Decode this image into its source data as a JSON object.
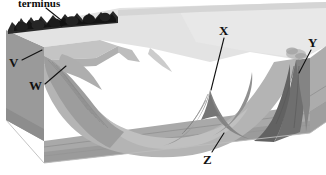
{
  "figure": {
    "kind": "block-diagram",
    "title_partial": "terminus",
    "palette": {
      "background": "#ffffff",
      "upland_surface": "#e3e3e3",
      "upper_slope": "#c9c9c9",
      "valley_floor": "#b4b4b4",
      "mid_slope": "#9d9d9d",
      "left_face": "#9a9a9a",
      "shadow_slope": "#8a8a8a",
      "deep_shadow": "#6f6f6f",
      "end_face": "#acacac",
      "strata_line": "#8f8f8f",
      "moraine_dark": "#2a2a2a",
      "ink": "#111111"
    }
  },
  "labels": [
    {
      "id": "top",
      "text": "terminus",
      "x": 18,
      "y": -2,
      "leader": {
        "x1": 46,
        "y1": 8,
        "x2": 66,
        "y2": 24
      }
    },
    {
      "id": "v",
      "text": "V",
      "x": 9,
      "y": 56,
      "leader": {
        "x1": 22,
        "y1": 60,
        "x2": 42,
        "y2": 50
      }
    },
    {
      "id": "w",
      "text": "W",
      "x": 29,
      "y": 79,
      "leader": {
        "x1": 45,
        "y1": 84,
        "x2": 66,
        "y2": 66
      }
    },
    {
      "id": "x",
      "text": "X",
      "x": 219,
      "y": 24,
      "leader": {
        "x1": 224,
        "y1": 38,
        "x2": 211,
        "y2": 90
      }
    },
    {
      "id": "y",
      "text": "Y",
      "x": 308,
      "y": 36,
      "leader": {
        "x1": 311,
        "y1": 50,
        "x2": 299,
        "y2": 73
      }
    },
    {
      "id": "z",
      "text": "Z",
      "x": 203,
      "y": 153,
      "leader": {
        "x1": 212,
        "y1": 152,
        "x2": 224,
        "y2": 133
      }
    }
  ]
}
